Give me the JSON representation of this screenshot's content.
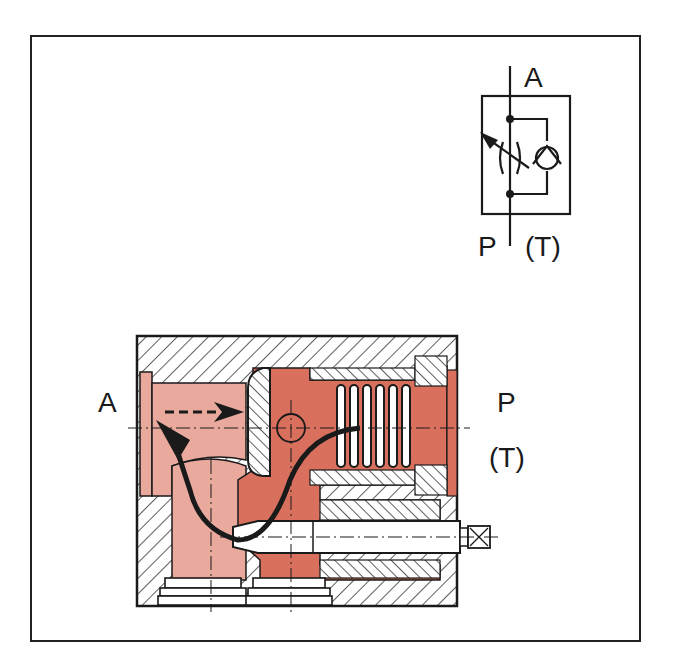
{
  "colors": {
    "frame": "#222222",
    "line": "#1a1a1a",
    "pressure_red": "#D9705E",
    "low_pink": "#E9A99C",
    "hatch": "#1a1a1a",
    "background": "#ffffff"
  },
  "symbol": {
    "title": "Throttle check valve symbol",
    "port_top": "A",
    "port_bottom": "P",
    "port_bottom_alt": "(T)",
    "elements": [
      "adjustable-throttle",
      "check-valve",
      "bypass-line",
      "junction-dots"
    ]
  },
  "section": {
    "title": "Sectional view of throttle check valve",
    "port_left": "A",
    "port_right": "P",
    "port_right_alt": "(T)",
    "elements": [
      "valve-body",
      "poppet",
      "spring",
      "adjusting-screw",
      "flow-arrow-dashed",
      "flow-arrow-solid"
    ]
  }
}
